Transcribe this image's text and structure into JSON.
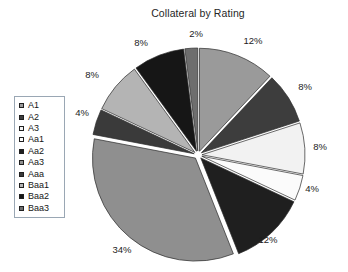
{
  "chart_data": {
    "type": "pie",
    "title": "Collateral by Rating",
    "xlabel": "",
    "ylabel": "",
    "legend_position": "left",
    "grid": false,
    "exploded": true,
    "categories": [
      "A1",
      "A2",
      "A3",
      "Aa1",
      "Aa2",
      "Aa3",
      "Aaa",
      "Baa1",
      "Baa2",
      "Baa3"
    ],
    "values": [
      12,
      8,
      8,
      4,
      12,
      34,
      4,
      8,
      8,
      2
    ],
    "value_labels": [
      "12%",
      "8%",
      "8%",
      "4%",
      "12%",
      "34%",
      "4%",
      "8%",
      "8%",
      "2%"
    ],
    "colors": [
      "#9a9a9a",
      "#3d3d3d",
      "#f2f2f2",
      "#fbfbfb",
      "#1f1f1f",
      "#8f8f8f",
      "#3a3a3a",
      "#b4b4b4",
      "#161616",
      "#6e6e6e"
    ],
    "slices": [
      {
        "label": "A1",
        "value": 12,
        "value_label": "12%",
        "color": "#9a9a9a",
        "label_x": 253,
        "label_y": 44
      },
      {
        "label": "A2",
        "value": 8,
        "value_label": "8%",
        "color": "#3d3d3d",
        "label_x": 305,
        "label_y": 90
      },
      {
        "label": "A3",
        "value": 8,
        "value_label": "8%",
        "color": "#f2f2f2",
        "label_x": 320,
        "label_y": 150
      },
      {
        "label": "Aa1",
        "value": 4,
        "value_label": "4%",
        "color": "#fbfbfb",
        "label_x": 312,
        "label_y": 192
      },
      {
        "label": "Aa2",
        "value": 12,
        "value_label": "12%",
        "color": "#1f1f1f",
        "label_x": 268,
        "label_y": 243
      },
      {
        "label": "Aa3",
        "value": 34,
        "value_label": "34%",
        "color": "#8f8f8f",
        "label_x": 122,
        "label_y": 253
      },
      {
        "label": "Aaa",
        "value": 4,
        "value_label": "4%",
        "color": "#3a3a3a",
        "label_x": 82,
        "label_y": 116
      },
      {
        "label": "Baa1",
        "value": 8,
        "value_label": "8%",
        "color": "#b4b4b4",
        "label_x": 92,
        "label_y": 78
      },
      {
        "label": "Baa2",
        "value": 8,
        "value_label": "8%",
        "color": "#161616",
        "label_x": 141,
        "label_y": 46
      },
      {
        "label": "Baa3",
        "value": 2,
        "value_label": "2%",
        "color": "#6e6e6e",
        "label_x": 196,
        "label_y": 37
      }
    ],
    "geometry": {
      "center_x": 198,
      "center_y": 155,
      "radius": 103,
      "start_angle_deg": -90,
      "explode_offset": 4
    }
  },
  "legend": {
    "items": [
      {
        "label": "A1",
        "color": "#9a9a9a"
      },
      {
        "label": "A2",
        "color": "#3d3d3d"
      },
      {
        "label": "A3",
        "color": "#f2f2f2"
      },
      {
        "label": "Aa1",
        "color": "#fbfbfb"
      },
      {
        "label": "Aa2",
        "color": "#1f1f1f"
      },
      {
        "label": "Aa3",
        "color": "#8f8f8f"
      },
      {
        "label": "Aaa",
        "color": "#3a3a3a"
      },
      {
        "label": "Baa1",
        "color": "#b4b4b4"
      },
      {
        "label": "Baa2",
        "color": "#161616"
      },
      {
        "label": "Baa3",
        "color": "#6e6e6e"
      }
    ]
  }
}
